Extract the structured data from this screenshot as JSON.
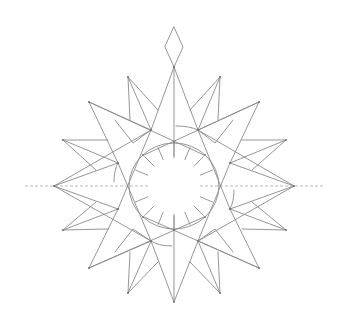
{
  "illustration": {
    "type": "geometric-star-compass-line-drawing",
    "background": "#ffffff",
    "line_color": "#8a8a8a",
    "dash_color": "#a8a8a8",
    "center": [
      174,
      186
    ],
    "inner_circle": {
      "rx": 45,
      "ry": 43
    },
    "radial_ticks": 16,
    "outer_points": 16,
    "top_diamond": {
      "top": [
        174,
        27
      ],
      "bottom": [
        174,
        67
      ],
      "half_width": 9
    },
    "horizontal_axis": {
      "x_start": 25,
      "x_end": 325
    }
  }
}
